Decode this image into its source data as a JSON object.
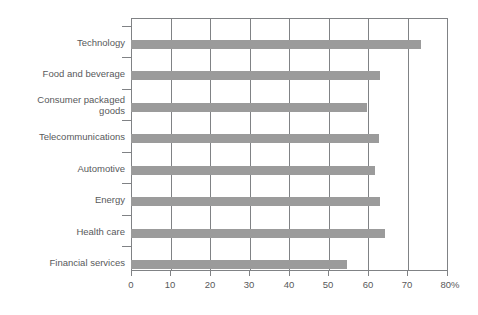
{
  "chart_data": {
    "type": "bar",
    "orientation": "horizontal",
    "title": "",
    "subtitle": "",
    "xlabel": "",
    "ylabel": "",
    "xlim": [
      0,
      80
    ],
    "ylim": null,
    "grid": true,
    "legend": false,
    "legend_position": "none",
    "bar_color": "#9b9b9b",
    "axis_color": "#808285",
    "text_color": "#58595b",
    "unit": "%",
    "categories": [
      "Technology",
      "Food and beverage",
      "Consumer packaged\ngoods",
      "Telecommunications",
      "Automotive",
      "Energy",
      "Health care",
      "Financial services"
    ],
    "values": [
      73.3,
      62.8,
      59.5,
      62.7,
      61.6,
      62.9,
      64.0,
      54.5
    ],
    "xticks": [
      0,
      10,
      20,
      30,
      40,
      50,
      60,
      70,
      80
    ],
    "xtick_labels": [
      "0",
      "10",
      "20",
      "30",
      "40",
      "50",
      "60",
      "70",
      "80%"
    ]
  }
}
